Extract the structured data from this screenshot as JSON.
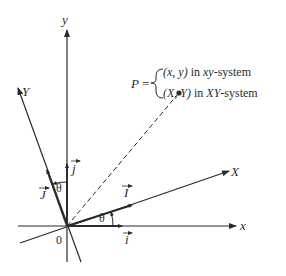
{
  "diagram": {
    "axes": {
      "x_label": "x",
      "y_label": "y",
      "X_label": "X",
      "Y_label": "Y",
      "origin_label": "0"
    },
    "unit_vectors": {
      "i": "i",
      "j": "j",
      "I": "I",
      "J": "J"
    },
    "angle_label": "θ",
    "point": {
      "name": "P",
      "equals": "=",
      "line1_a": "(x, y)",
      "line1_b": " in ",
      "line1_c": "xy",
      "line1_d": "-system",
      "line2_a": "(X, Y)",
      "line2_b": " in ",
      "line2_c": "XY",
      "line2_d": "-system"
    },
    "colors": {
      "ink": "#2b2b2b",
      "background": "#ffffff"
    }
  }
}
